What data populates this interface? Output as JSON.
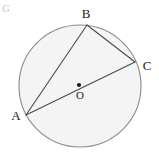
{
  "figure": {
    "kind": "circle-geometry-diagram",
    "background_color": "#ffffff",
    "circle": {
      "center_x": 80,
      "center_y": 86,
      "radius": 61,
      "fill_color": "#f4f4f4",
      "stroke_color": "#8a8a8a",
      "stroke_width": 1.1
    },
    "center_marker": {
      "x": 79,
      "y": 85,
      "radius": 2.1,
      "color": "#1a1a1a",
      "label": "O",
      "label_x": 80,
      "label_y": 99
    },
    "points": [
      {
        "id": "A",
        "label": "A",
        "x": 26,
        "y": 115,
        "label_x": 16,
        "label_y": 120,
        "anchor": "middle"
      },
      {
        "id": "B",
        "label": "B",
        "x": 87,
        "y": 25,
        "label_x": 86,
        "label_y": 18,
        "anchor": "middle"
      },
      {
        "id": "C",
        "label": "C",
        "x": 135,
        "y": 62,
        "label_x": 147,
        "label_y": 70,
        "anchor": "middle"
      }
    ],
    "segments": [
      {
        "id": "AB",
        "from": "A",
        "to": "B",
        "x1": 26,
        "y1": 115,
        "x2": 87,
        "y2": 25,
        "stroke_color": "#4a4a4a",
        "stroke_width": 1.1
      },
      {
        "id": "BC",
        "from": "B",
        "to": "C",
        "x1": 87,
        "y1": 25,
        "x2": 135,
        "y2": 62,
        "stroke_color": "#4a4a4a",
        "stroke_width": 1.1
      },
      {
        "id": "AC",
        "from": "A",
        "to": "C",
        "x1": 26,
        "y1": 115,
        "x2": 135,
        "y2": 62,
        "stroke_color": "#4a4a4a",
        "stroke_width": 1.1
      }
    ],
    "corner_artifact": {
      "text": "G",
      "x": 2,
      "y": 12
    }
  }
}
